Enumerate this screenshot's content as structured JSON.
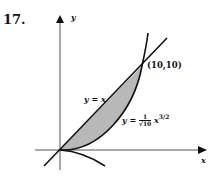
{
  "problem_number": "17.",
  "axes": {
    "x_label": "x",
    "y_label": "y"
  },
  "curves": {
    "line_label": "y = x",
    "curve_label_prefix": "y =",
    "curve_label_num": "1",
    "curve_label_den": "√10",
    "curve_label_var": "x",
    "curve_label_exp": "3/2"
  },
  "intersection_label": "(10,10)",
  "colors": {
    "shade": "#b8b8b8",
    "stroke": "#111111"
  }
}
